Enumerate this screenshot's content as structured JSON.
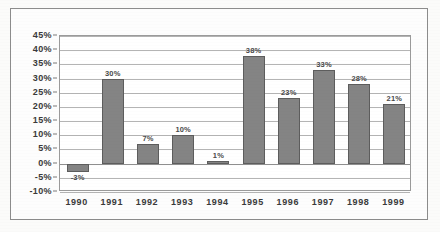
{
  "chart_data": {
    "type": "bar",
    "title": "",
    "subtitle": "",
    "xlabel": "",
    "ylabel": "",
    "categories": [
      "1990",
      "1991",
      "1992",
      "1993",
      "1994",
      "1995",
      "1996",
      "1997",
      "1998",
      "1999"
    ],
    "values": [
      -3,
      30,
      7,
      10,
      1,
      38,
      23,
      33,
      28,
      21
    ],
    "data_labels": [
      "-3%",
      "30%",
      "7%",
      "10%",
      "1%",
      "38%",
      "23%",
      "33%",
      "28%",
      "21%"
    ],
    "ylim": [
      -10,
      45
    ],
    "ytick_values": [
      45,
      40,
      35,
      30,
      25,
      20,
      15,
      10,
      5,
      0,
      -5,
      -10
    ],
    "ytick_labels": [
      "45%",
      "40%",
      "35%",
      "30%",
      "25%",
      "20%",
      "15%",
      "10%",
      "5%",
      "0%",
      "-5%",
      "-10%"
    ],
    "grid": true,
    "legend": false,
    "legend_position": "none",
    "bar_color": "#848484",
    "bar_border_color": "#5d5d5d",
    "plot_background": "#ffffff",
    "gridline_color": "#b4b4b4",
    "frame_color": "#8c8c8c",
    "page_background": "#fbfbfa",
    "text_color": "#3a3a3a"
  }
}
